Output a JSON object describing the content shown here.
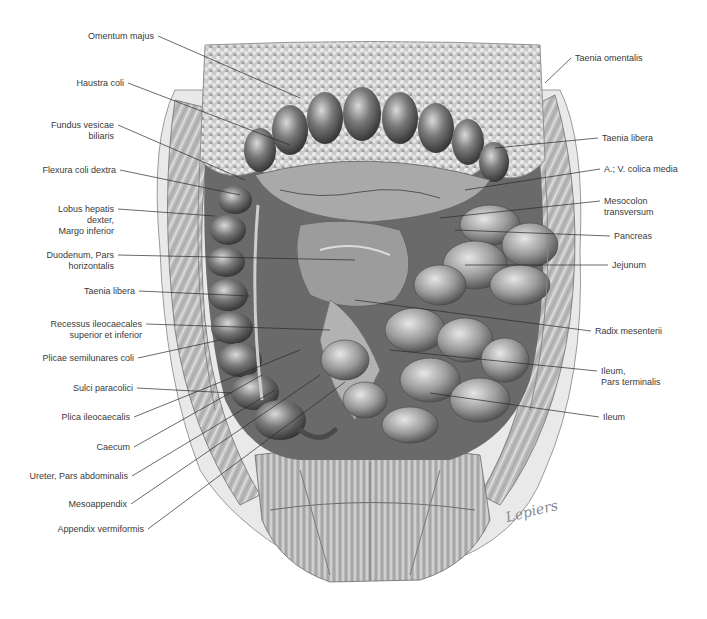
{
  "figure": {
    "signature": "Lepiers",
    "text_color": "#3a3a3a",
    "line_color": "#2a2a2a"
  },
  "labels": {
    "left": [
      {
        "id": "omentum-majus",
        "text": "Omentum majus",
        "x": 158,
        "y": 36,
        "tx": 300,
        "ty": 98
      },
      {
        "id": "haustra-coli",
        "text": "Haustra coli",
        "x": 128,
        "y": 83,
        "tx": 290,
        "ty": 145
      },
      {
        "id": "fundus-vesicae-biliaris",
        "text": "Fundus vesicae\nbiliaris",
        "x": 118,
        "y": 125,
        "tx": 245,
        "ty": 180
      },
      {
        "id": "flexura-coli-dextra",
        "text": "Flexura coli dextra",
        "x": 120,
        "y": 170,
        "tx": 240,
        "ty": 195
      },
      {
        "id": "lobus-hepatis",
        "text": "Lobus hepatis\ndexter,\nMargo inferior",
        "x": 118,
        "y": 209,
        "tx": 215,
        "ty": 216
      },
      {
        "id": "duodenum-pars-horizontalis",
        "text": "Duodenum, Pars\nhorizontalis",
        "x": 118,
        "y": 255,
        "tx": 355,
        "ty": 260
      },
      {
        "id": "taenia-libera-left",
        "text": "Taenia libera",
        "x": 139,
        "y": 291,
        "tx": 250,
        "ty": 296
      },
      {
        "id": "recessus-ileocaecales",
        "text": "Recessus ileocaecales\nsuperior et inferior",
        "x": 146,
        "y": 324,
        "tx": 330,
        "ty": 330
      },
      {
        "id": "plicae-semilunares-coli",
        "text": "Plicae semilunares coli",
        "x": 138,
        "y": 358,
        "tx": 220,
        "ty": 340
      },
      {
        "id": "sulci-paracolici",
        "text": "Sulci paracolici",
        "x": 137,
        "y": 388,
        "tx": 232,
        "ty": 393
      },
      {
        "id": "plica-ileocaecalis",
        "text": "Plica ileocaecalis",
        "x": 134,
        "y": 417,
        "tx": 300,
        "ty": 350
      },
      {
        "id": "caecum",
        "text": "Caecum",
        "x": 134,
        "y": 447,
        "tx": 262,
        "ty": 375
      },
      {
        "id": "ureter-pars-abdominalis",
        "text": "Ureter, Pars abdominalis",
        "x": 132,
        "y": 476,
        "tx": 275,
        "ty": 390
      },
      {
        "id": "mesoappendix",
        "text": "Mesoappendix",
        "x": 131,
        "y": 504,
        "tx": 320,
        "ty": 375
      },
      {
        "id": "appendix-vermiformis",
        "text": "Appendix vermiformis",
        "x": 148,
        "y": 529,
        "tx": 345,
        "ty": 382
      }
    ],
    "right": [
      {
        "id": "taenia-omentalis",
        "text": "Taenia omentalis",
        "x": 571,
        "y": 58,
        "tx": 545,
        "ty": 83
      },
      {
        "id": "taenia-libera-right",
        "text": "Taenia libera",
        "x": 598,
        "y": 138,
        "tx": 495,
        "ty": 148
      },
      {
        "id": "a-v-colica-media",
        "text": "A.; V. colica media",
        "x": 600,
        "y": 169,
        "tx": 465,
        "ty": 190
      },
      {
        "id": "mesocolon-transversum",
        "text": "Mesocolon\ntransversum",
        "x": 600,
        "y": 201,
        "tx": 440,
        "ty": 218
      },
      {
        "id": "pancreas",
        "text": "Pancreas",
        "x": 610,
        "y": 236,
        "tx": 455,
        "ty": 230
      },
      {
        "id": "jejunum",
        "text": "Jejunum",
        "x": 608,
        "y": 265,
        "tx": 465,
        "ty": 265
      },
      {
        "id": "radix-mesenterii",
        "text": "Radix mesenterii",
        "x": 591,
        "y": 331,
        "tx": 355,
        "ty": 300
      },
      {
        "id": "ileum-pars-terminalis",
        "text": "Ileum,\nPars terminalis",
        "x": 597,
        "y": 371,
        "tx": 390,
        "ty": 350
      },
      {
        "id": "ileum",
        "text": "Ileum",
        "x": 599,
        "y": 417,
        "tx": 430,
        "ty": 393
      }
    ]
  }
}
